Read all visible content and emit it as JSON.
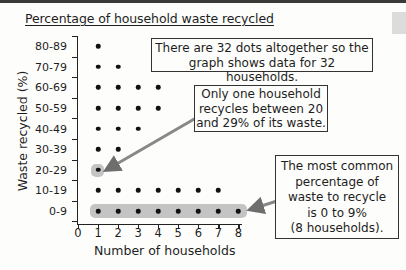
{
  "title": "Percentage of household waste recycled",
  "colors": {
    "dot": "#111111",
    "highlight": "#c4c4c4",
    "arrow": "#777777",
    "axis": "#222222",
    "topbar": "#3a3a3a"
  },
  "chart_data": {
    "type": "scatter",
    "subtype": "dot-plot",
    "title": "Percentage of household waste recycled",
    "xlabel": "Number of households",
    "ylabel": "Waste recycled (%)",
    "x_ticks": [
      "0",
      "1",
      "2",
      "3",
      "4",
      "5",
      "6",
      "7",
      "8"
    ],
    "xlim": [
      0,
      8
    ],
    "categories": [
      "0-9",
      "10-19",
      "20-29",
      "30-39",
      "40-49",
      "50-59",
      "60-69",
      "70-79",
      "80-89"
    ],
    "values": [
      8,
      7,
      1,
      2,
      3,
      4,
      4,
      2,
      1
    ],
    "total": 32,
    "grid": false,
    "highlighted_categories": [
      "0-9",
      "20-29"
    ],
    "annotations": [
      "There are 32 dots altogether so the graph shows data for 32 households.",
      "Only one household recycles between 20 and 29% of its waste.",
      "The most common percentage of waste to recycle is 0 to 9% (8 households)."
    ]
  },
  "axes": {
    "xlabel": "Number of households",
    "ylabel": "Waste recycled (%)",
    "x_ticks": [
      "0",
      "1",
      "2",
      "3",
      "4",
      "5",
      "6",
      "7",
      "8"
    ],
    "y_ticks": [
      "80-89",
      "70-79",
      "60-69",
      "50-59",
      "40-49",
      "30-39",
      "20-29",
      "10-19",
      "0-9"
    ]
  },
  "callouts": {
    "total": {
      "lines": [
        "There are 32 dots altogether so the",
        "graph shows data for 32 households."
      ]
    },
    "single": {
      "lines": [
        "Only one household",
        "recycles between 20",
        "and 29% of its waste."
      ]
    },
    "mode": {
      "lines": [
        "The most common",
        "percentage of",
        "waste to recycle",
        "is 0 to 9%",
        "(8 households)."
      ]
    }
  }
}
